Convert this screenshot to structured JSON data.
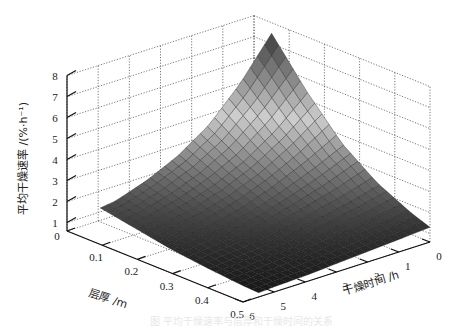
{
  "chart_data": {
    "type": "surface3d",
    "title": "",
    "xlabel": "层厚 /m",
    "ylabel": "干燥时间 /h",
    "zlabel": "平均干燥速率 /(%·h⁻¹)",
    "x_axis": {
      "name": "layer_thickness_m",
      "ticks": [
        "0",
        "0.1",
        "0.2",
        "0.3",
        "0.4",
        "0.5"
      ],
      "range": [
        0,
        0.5
      ]
    },
    "y_axis": {
      "name": "drying_time_h",
      "ticks": [
        "0",
        "1",
        "2",
        "3",
        "4",
        "5",
        "6"
      ],
      "range": [
        0,
        6
      ]
    },
    "z_axis": {
      "name": "avg_drying_rate",
      "ticks": [
        "1",
        "2",
        "3",
        "4",
        "5",
        "6",
        "7",
        "8"
      ],
      "range": [
        0.6,
        8
      ]
    },
    "grid": true,
    "colormap": "gray (dark = low, light = mid, dark = peak)",
    "surface_samples": {
      "layer": [
        0.05,
        0.15,
        0.25,
        0.35,
        0.45,
        0.5
      ],
      "time": [
        0,
        1,
        2,
        3,
        4,
        5,
        5.5
      ],
      "rate": [
        [
          7.5,
          5.6,
          4.1,
          3.1,
          2.4,
          1.9,
          1.8
        ],
        [
          5.4,
          4.1,
          3.1,
          2.4,
          1.9,
          1.6,
          1.5
        ],
        [
          3.6,
          2.9,
          2.3,
          1.8,
          1.5,
          1.3,
          1.2
        ],
        [
          2.4,
          2.0,
          1.7,
          1.4,
          1.2,
          1.05,
          1.0
        ],
        [
          1.6,
          1.4,
          1.25,
          1.1,
          1.0,
          0.9,
          0.85
        ],
        [
          1.3,
          1.2,
          1.1,
          1.0,
          0.9,
          0.85,
          0.8
        ]
      ]
    },
    "peak": {
      "layer": 0.05,
      "time": 0,
      "rate": 7.5
    }
  },
  "labels": {
    "z_title": "平均干燥速率 /(%·h⁻¹)",
    "x_title": "层厚 /m",
    "y_title": "干燥时间 /h",
    "caption": "图 平均干燥速率与层厚和干燥时间的关系"
  }
}
